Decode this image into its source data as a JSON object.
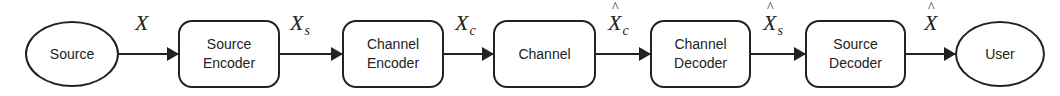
{
  "diagram": {
    "type": "block-flow",
    "nodes": [
      {
        "id": "source",
        "label": "Source",
        "shape": "ellipse"
      },
      {
        "id": "source_encoder",
        "label": "Source\nEncoder",
        "shape": "rounded-rect"
      },
      {
        "id": "channel_encoder",
        "label": "Channel\nEncoder",
        "shape": "rounded-rect"
      },
      {
        "id": "channel",
        "label": "Channel",
        "shape": "rounded-rect"
      },
      {
        "id": "channel_decoder",
        "label": "Channel\nDecoder",
        "shape": "rounded-rect"
      },
      {
        "id": "source_decoder",
        "label": "Source\nDecoder",
        "shape": "rounded-rect"
      },
      {
        "id": "user",
        "label": "User",
        "shape": "ellipse"
      }
    ],
    "edges": [
      {
        "from": "source",
        "to": "source_encoder",
        "symbol": "X",
        "sub": "",
        "hat": false
      },
      {
        "from": "source_encoder",
        "to": "channel_encoder",
        "symbol": "X",
        "sub": "s",
        "hat": false
      },
      {
        "from": "channel_encoder",
        "to": "channel",
        "symbol": "X",
        "sub": "c",
        "hat": false
      },
      {
        "from": "channel",
        "to": "channel_decoder",
        "symbol": "X",
        "sub": "c",
        "hat": true
      },
      {
        "from": "channel_decoder",
        "to": "source_decoder",
        "symbol": "X",
        "sub": "s",
        "hat": true
      },
      {
        "from": "source_decoder",
        "to": "user",
        "symbol": "X",
        "sub": "",
        "hat": true
      }
    ]
  }
}
